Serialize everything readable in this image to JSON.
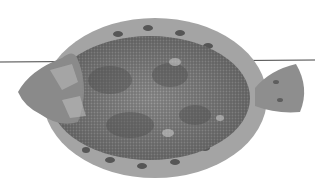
{
  "image": {
    "subject": "flatfish",
    "description": "Grayscale photograph of a flatfish (flounder) viewed from above on a white background, with a thin horizontal line crossing behind it",
    "background_color": "#ffffff",
    "colors": {
      "body": "#8a8a8a",
      "body_dark": "#5e5e5e",
      "fin_fringe": "#9a9a9a",
      "fin_spots": "#3a3a3a",
      "line": "#444444"
    }
  }
}
